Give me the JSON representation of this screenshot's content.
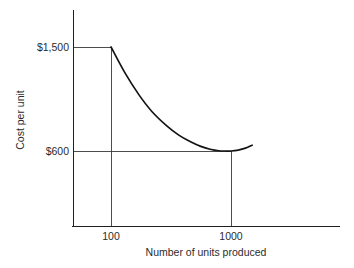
{
  "chart_data": {
    "type": "line",
    "title": "",
    "subtitle": "",
    "xlabel": "Number of units produced",
    "ylabel": "Cost per unit",
    "x_tick_labels": [
      "100",
      "1000"
    ],
    "y_tick_labels": [
      "$1,500",
      "$600"
    ],
    "x_ticks": [
      100,
      1000
    ],
    "y_ticks": [
      1500,
      600
    ],
    "grid": false,
    "legend": null,
    "legend_position": "none",
    "annotations": [
      "Horizontal guide line from y-axis to the curve start at $1,500",
      "Vertical guide line dropping from $1,500 at 100 units to the x-axis",
      "Horizontal guide line at $600 extending to the curve minimum",
      "Vertical guide line dropping from $600 at 1000 units to the x-axis"
    ],
    "series": [
      {
        "name": "Cost per unit curve",
        "x": [
          100,
          130,
          170,
          220,
          290,
          370,
          460,
          560,
          670,
          790,
          900,
          1000,
          1150,
          1320,
          1500
        ],
        "values": [
          1500,
          1280,
          1090,
          940,
          820,
          735,
          680,
          640,
          615,
          602,
          600,
          600,
          608,
          625,
          650
        ]
      }
    ],
    "curve_description": "Cost per unit falls steeply from $1,500 at 100 units, flattens to a minimum of $600 near 1000 units, then rises slightly beyond 1000 units",
    "xlim": [
      60,
      1750
    ],
    "ylim": [
      0,
      1700
    ],
    "colors": {
      "curve": "#141414",
      "axis": "#1f1f1f",
      "guide": "#3a3a3a",
      "text": "#2b2b2b",
      "background": "#ffffff"
    }
  },
  "geometry": {
    "y_axis_x": 73,
    "y_axis_top": 10,
    "x_axis_y": 226,
    "x_axis_left": 72,
    "x_axis_right": 340,
    "level_1500_y": 47,
    "level_600_y": 151,
    "tick_100_x": 111,
    "tick_1000_x": 231,
    "curve_end_x": 266,
    "curve_end_y": 143
  }
}
